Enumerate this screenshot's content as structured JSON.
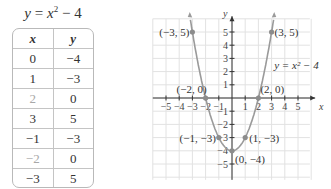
{
  "title": {
    "y": "y",
    "eq": " = ",
    "x": "x",
    "exp": "2",
    "rest": " − 4"
  },
  "table": {
    "headers": [
      "x",
      "y"
    ],
    "rows": [
      {
        "x": "0",
        "y": "−4",
        "highlight": false
      },
      {
        "x": "1",
        "y": "−3",
        "highlight": false
      },
      {
        "x": "2",
        "y": "0",
        "highlight": true
      },
      {
        "x": "3",
        "y": "5",
        "highlight": false
      },
      {
        "x": "−1",
        "y": "−3",
        "highlight": false
      },
      {
        "x": "−2",
        "y": "0",
        "highlight": true
      },
      {
        "x": "−3",
        "y": "5",
        "highlight": false
      }
    ]
  },
  "chart_data": {
    "type": "line",
    "title": "y = x² − 4",
    "xlabel": "x",
    "ylabel": "y",
    "xlim": [
      -5.5,
      5.5
    ],
    "ylim": [
      -5.5,
      5.5
    ],
    "grid": true,
    "x_ticks": [
      -5,
      -4,
      -3,
      -2,
      -1,
      1,
      2,
      3,
      4,
      5
    ],
    "y_ticks": [
      -5,
      -4,
      -3,
      -2,
      -1,
      1,
      2,
      3,
      4,
      5
    ],
    "curve_label": "y = x² − 4",
    "points": [
      {
        "x": -3,
        "y": 5,
        "label": "(−3, 5)"
      },
      {
        "x": 3,
        "y": 5,
        "label": "(3, 5)"
      },
      {
        "x": -2,
        "y": 0,
        "label": "(−2, 0)"
      },
      {
        "x": 2,
        "y": 0,
        "label": "(2, 0)"
      },
      {
        "x": -1,
        "y": -3,
        "label": "(−1, −3)"
      },
      {
        "x": 1,
        "y": -3,
        "label": "(1, −3)"
      },
      {
        "x": 0,
        "y": -4,
        "label": "(0, −4)"
      }
    ],
    "colors": {
      "curve": "#9a9a9a",
      "point": "#8c8c8c",
      "grid": "#e2e2e2",
      "axis": "#333333",
      "highlight": "#a8a8a8"
    }
  }
}
